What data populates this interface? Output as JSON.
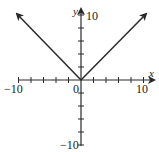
{
  "chart_data": {
    "type": "line",
    "title": "",
    "function": "y = |x|",
    "xlabel": "x",
    "ylabel": "y",
    "xlim": [
      -10,
      10
    ],
    "ylim": [
      -10,
      10
    ],
    "grid": false,
    "legend": null,
    "x_tick_step": 2,
    "y_tick_step": 2,
    "x_tick_labels": [
      "-10",
      "0",
      "10"
    ],
    "y_tick_labels": [
      "10",
      "-10"
    ],
    "series": [
      {
        "name": "y = |x|",
        "points": [
          [
            -10,
            10
          ],
          [
            0,
            0
          ],
          [
            10,
            10
          ]
        ],
        "arrows_at_ends": true,
        "color": "#2a2a2a"
      }
    ]
  },
  "labels": {
    "x_axis": "x",
    "y_axis": "y",
    "x_min": "−10",
    "x_max": "10",
    "origin": "0",
    "y_max": "10",
    "y_min": "−10"
  }
}
